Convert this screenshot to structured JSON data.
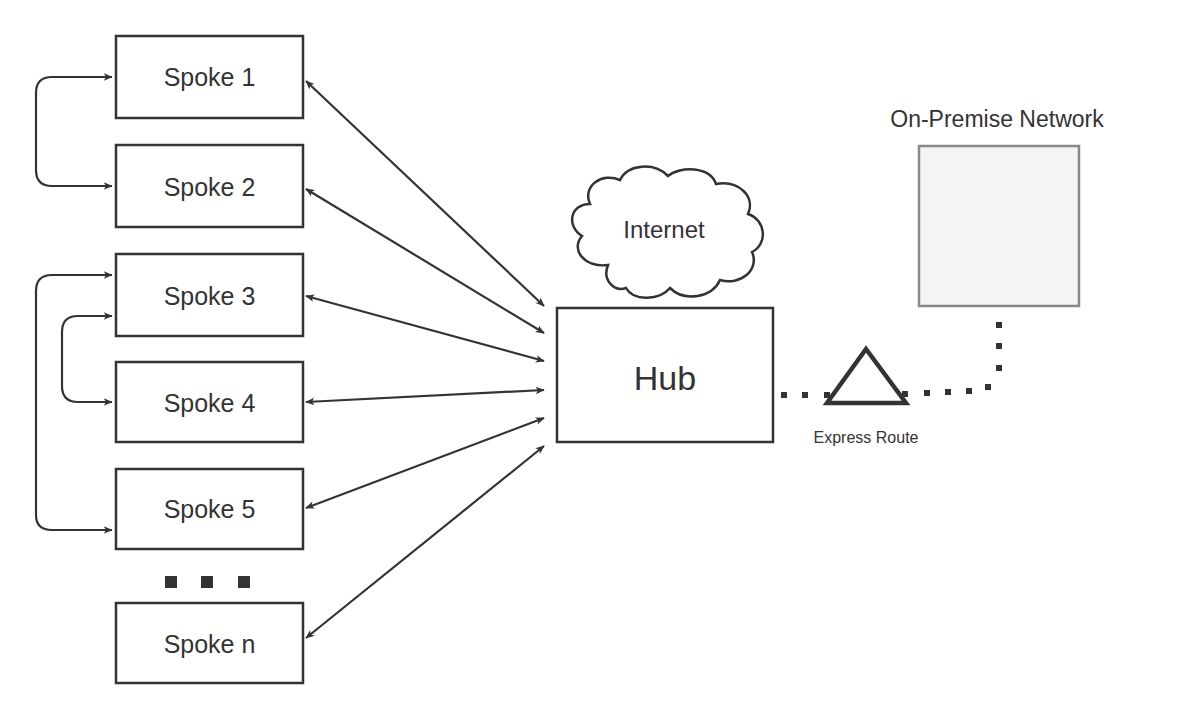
{
  "diagram": {
    "colors": {
      "stroke": "#333333",
      "onprem_fill": "#f4f4f4",
      "onprem_stroke": "#888888",
      "background": "#ffffff"
    },
    "spokes": [
      {
        "id": "spoke1",
        "label": "Spoke 1"
      },
      {
        "id": "spoke2",
        "label": "Spoke 2"
      },
      {
        "id": "spoke3",
        "label": "Spoke 3"
      },
      {
        "id": "spoke4",
        "label": "Spoke 4"
      },
      {
        "id": "spoke5",
        "label": "Spoke 5"
      },
      {
        "id": "spoken",
        "label": "Spoke n"
      }
    ],
    "ellipsis": "...",
    "hub": {
      "label": "Hub"
    },
    "internet": {
      "label": "Internet"
    },
    "express_route": {
      "label": "Express Route"
    },
    "on_premise": {
      "label": "On-Premise Network"
    },
    "edges": [
      {
        "from": "spoke1",
        "to": "hub",
        "type": "bidirectional"
      },
      {
        "from": "spoke2",
        "to": "hub",
        "type": "bidirectional"
      },
      {
        "from": "spoke3",
        "to": "hub",
        "type": "bidirectional"
      },
      {
        "from": "spoke4",
        "to": "hub",
        "type": "bidirectional"
      },
      {
        "from": "spoke5",
        "to": "hub",
        "type": "bidirectional"
      },
      {
        "from": "spoken",
        "to": "hub",
        "type": "bidirectional"
      },
      {
        "from": "spoke1",
        "to": "spoke2",
        "type": "bidirectional-peering"
      },
      {
        "from": "spoke3",
        "to": "spoke4",
        "type": "bidirectional-peering"
      },
      {
        "from": "spoke3",
        "to": "spoke5",
        "type": "bidirectional-peering"
      },
      {
        "from": "hub",
        "to": "express_route",
        "type": "dotted"
      },
      {
        "from": "express_route",
        "to": "on_premise",
        "type": "dotted"
      }
    ]
  }
}
